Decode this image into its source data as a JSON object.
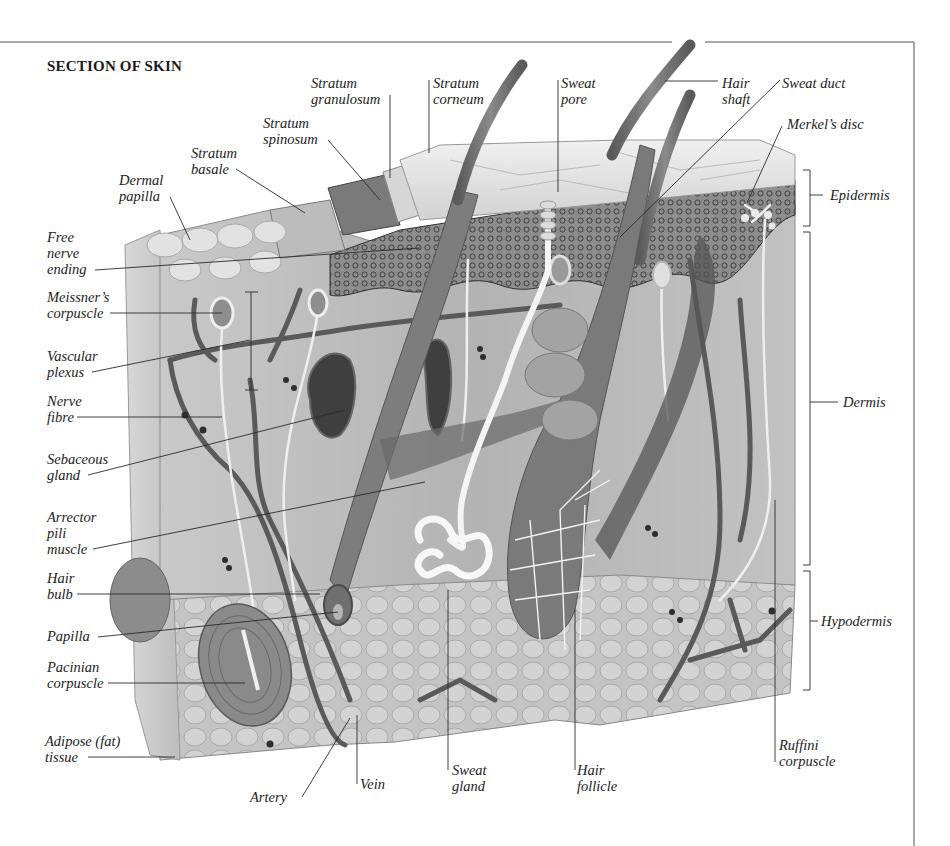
{
  "title": "SECTION OF SKIN",
  "labels": {
    "stratum_granulosum": "Stratum\ngranulosum",
    "stratum_corneum": "Stratum\ncorneum",
    "sweat_pore": "Sweat\npore",
    "hair_shaft": "Hair\nshaft",
    "sweat_duct": "Sweat duct",
    "stratum_spinosum": "Stratum\nspinosum",
    "merkels_disc": "Merkel’s disc",
    "stratum_basale": "Stratum\nbasale",
    "dermal_papilla": "Dermal\npapilla",
    "epidermis": "Epidermis",
    "free_nerve_ending": "Free\nnerve\nending",
    "meissners_corpuscle": "Meissner’s\ncorpuscle",
    "vascular_plexus": "Vascular\nplexus",
    "nerve_fibre": "Nerve\nfibre",
    "dermis": "Dermis",
    "sebaceous_gland": "Sebaceous\ngland",
    "arrector_pili_muscle": "Arrector\npili\nmuscle",
    "hair_bulb": "Hair\nbulb",
    "hypodermis": "Hypodermis",
    "papilla": "Papilla",
    "pacinian_corpuscle": "Pacinian\ncorpuscle",
    "adipose_tissue": "Adipose (fat)\ntissue",
    "ruffini_corpuscle": "Ruffini\ncorpuscle",
    "artery": "Artery",
    "vein": "Vein",
    "sweat_gland": "Sweat\ngland",
    "hair_follicle": "Hair\nfollicle"
  },
  "colors": {
    "ink": "#222222",
    "dermis": "#b9b9b9",
    "epidermis_dark": "#4a4a4a",
    "corneum": "#e4e4e4",
    "vessel": "#5e5e5e",
    "nerve": "#f0f0f0",
    "hair": "#707070"
  }
}
